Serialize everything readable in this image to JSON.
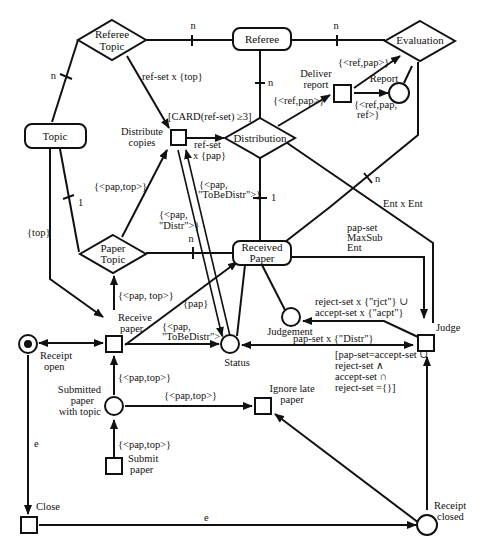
{
  "diagram": {
    "type": "ER / Petri-net hybrid (conference paper reviewing)",
    "entities": [
      {
        "id": "referee",
        "label": "Referee",
        "shape": "rounded-rect"
      },
      {
        "id": "topic",
        "label": "Topic",
        "shape": "rounded-rect"
      },
      {
        "id": "received_paper",
        "label_line1": "Received",
        "label_line2": "Paper",
        "shape": "rounded-rect"
      }
    ],
    "relationships": [
      {
        "id": "referee_topic",
        "label_line1": "Referee",
        "label_line2": "Topic",
        "shape": "diamond"
      },
      {
        "id": "evaluation",
        "label": "Evaluation",
        "shape": "diamond"
      },
      {
        "id": "distribution",
        "label": "Distribution",
        "shape": "diamond"
      },
      {
        "id": "paper_topic",
        "label_line1": "Paper",
        "label_line2": "Topic",
        "shape": "diamond"
      }
    ],
    "places": [
      {
        "id": "report",
        "label": "Report"
      },
      {
        "id": "status",
        "label": "Status"
      },
      {
        "id": "judgement",
        "label": "Judgement"
      },
      {
        "id": "receipt_open",
        "label_line1": "Receipt",
        "label_line2": "open",
        "marked": true
      },
      {
        "id": "submitted",
        "label_line1": "Submitted",
        "label_line2": "paper",
        "label_line3": "with topic"
      },
      {
        "id": "receipt_closed",
        "label_line1": "Receipt",
        "label_line2": "closed"
      }
    ],
    "transitions": [
      {
        "id": "distribute_copies",
        "label_line1": "Distribute",
        "label_line2": "copies"
      },
      {
        "id": "deliver_report",
        "label_line1": "Deliver",
        "label_line2": "report"
      },
      {
        "id": "receive_paper",
        "label_line1": "Receive",
        "label_line2": "paper"
      },
      {
        "id": "judge",
        "label": "Judge"
      },
      {
        "id": "ignore_late",
        "label_line1": "Ignore late",
        "label_line2": "paper"
      },
      {
        "id": "submit_paper",
        "label_line1": "Submit",
        "label_line2": "paper"
      },
      {
        "id": "close",
        "label": "Close"
      }
    ],
    "cardinalities": {
      "rt_referee": "n",
      "referee_distribution": "n",
      "referee_evaluation": "n",
      "rt_topic": "n",
      "topic_pt": "1",
      "pt_received": "n",
      "distribution_received": "1",
      "evaluation_received": "n"
    },
    "arc_labels": {
      "rt_to_dist": "ref-set x {top}",
      "guard_dist": "[CARD(ref-set) ≥3]",
      "dist_out_1": "ref-set",
      "dist_out_2": "x {pap}",
      "pt_to_dist": "{<pap,top>}",
      "status_dist_1": "{<pap,",
      "status_dist_2": "\"ToBeDistr\">}",
      "dist_status_1": "{<pap,",
      "dist_status_2": "\"Distr\">}",
      "dist_to_deliver": "{<ref,pap>}",
      "deliver_to_eval": "{<ref,pap>}",
      "deliver_to_report_1": "{<ref,pap,",
      "deliver_to_report_2": "ref>}",
      "ent_x_ent": "Ent x Ent",
      "pap_set_1": "pap-set",
      "pap_set_2": "MaxSub",
      "pap_set_3": "Ent",
      "judge_to_judgement_1": "reject-set x {\"rjct\"} ∪",
      "judge_to_judgement_2": "accept-set x {\"acpt\"}",
      "status_judge": "pap-set x {\"Distr\"}",
      "guard_judge_1": "[pap-set=accept-set ∪",
      "guard_judge_2": "reject-set ∧",
      "guard_judge_3": "accept-set ∩",
      "guard_judge_4": "reject-set ={}]",
      "topic_receive": "{top}",
      "receive_to_pt": "{<pap, top>}",
      "receive_to_received": "{pap}",
      "receive_to_status_1": "{<pap,",
      "receive_to_status_2": "\"ToBeDistr\">}",
      "submitted_to_receive": "{<pap,top>}",
      "submitted_to_ignore": "{<pap,top>}",
      "submit_to_submitted": "{<pap,top>}",
      "open_close": "e",
      "close_closed": "e"
    }
  }
}
